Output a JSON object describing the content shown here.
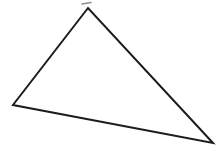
{
  "canvas": {
    "width": 221,
    "height": 157,
    "background": "#ffffff"
  },
  "figure": {
    "label": "scalene-triangle",
    "triangle": {
      "points": "88,8 13,105 213,143",
      "vertices": [
        [
          88,
          8
        ],
        [
          13,
          105
        ],
        [
          213,
          143
        ]
      ],
      "stroke_color": "#1c1c1c",
      "stroke_width": 2,
      "fill": "none"
    },
    "pen_overshoot_mark": {
      "points": "82,4 91,2.5",
      "stroke_color": "#8f8f8f",
      "stroke_width": 1.5
    }
  }
}
